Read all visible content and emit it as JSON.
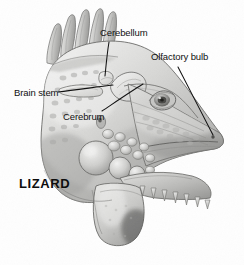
{
  "figure": {
    "subject": "LIZARD",
    "title": "LIZARD",
    "view": "lateral head with brain anatomy",
    "background_color": "#fefefe",
    "ink_color": "#111111"
  },
  "labels": [
    {
      "id": "cerebellum",
      "text": "Cerebellum",
      "name": "label-cerebellum"
    },
    {
      "id": "olfactory_bulb",
      "text": "Olfactory bulb",
      "name": "label-olfactory-bulb"
    },
    {
      "id": "brain_stem",
      "text": "Brain stem",
      "name": "label-brain-stem"
    },
    {
      "id": "cerebrum",
      "text": "Cerebrum",
      "name": "label-cerebrum"
    }
  ],
  "label_text": {
    "cerebellum": "Cerebellum",
    "olfactory_bulb": "Olfactory bulb",
    "brain_stem": "Brain stem",
    "cerebrum": "Cerebrum"
  },
  "illustration": {
    "style": "grayscale pencil / airbrush anatomical drawing",
    "features": [
      "dorsal crest spines",
      "cranial dome",
      "eye",
      "nostril",
      "tympanic scale",
      "jowl scales",
      "dewlap",
      "teeth",
      "brain outline"
    ],
    "spine_count": 5,
    "tooth_count": 7,
    "tones": {
      "light": "#e3e3e1",
      "mid": "#bdbdbb",
      "shadow": "#8f8f8d",
      "dark": "#6a6a68",
      "line": "#4a4a48"
    }
  }
}
